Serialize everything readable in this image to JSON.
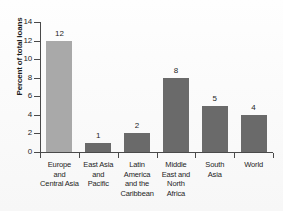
{
  "chart_data": {
    "type": "bar",
    "title": "",
    "subtitle": "",
    "xlabel": "",
    "ylabel": "Percent of total loans",
    "ylim": [
      0,
      14
    ],
    "yticks": [
      0,
      2,
      4,
      6,
      8,
      10,
      12,
      14
    ],
    "ytick_labels": [
      "0",
      "2",
      "4",
      "6",
      "8",
      "10",
      "12",
      "14"
    ],
    "grid": false,
    "legend": null,
    "categories": [
      "Europe and Central Asia",
      "East Asia and Pacific",
      "Latin America and the Caribbean",
      "Middle East and North Africa",
      "South Asia",
      "World"
    ],
    "category_lines": [
      [
        "Europe",
        "and",
        "Central Asia"
      ],
      [
        "East Asia",
        "and",
        "Pacific"
      ],
      [
        "Latin",
        "America",
        "and the",
        "Caribbean"
      ],
      [
        "Middle",
        "East and",
        "North",
        "Africa"
      ],
      [
        "South",
        "Asia"
      ],
      [
        "World"
      ]
    ],
    "values": [
      12,
      1,
      2,
      8,
      5,
      4
    ],
    "value_labels": [
      "12",
      "1",
      "2",
      "8",
      "5",
      "4"
    ],
    "bar_colors": [
      "#a9a9a9",
      "#6a6a6a",
      "#6a6a6a",
      "#6a6a6a",
      "#6a6a6a",
      "#6a6a6a"
    ],
    "axis_color": "#4a4a4a",
    "text_color": "#262626",
    "background_color": "#fdfdfd"
  }
}
